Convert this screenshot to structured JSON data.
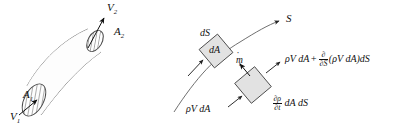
{
  "figure": {
    "background_color": "#ffffff",
    "line_color": "#555555",
    "label_color": "#111111",
    "element_fill": "#e2e2e2",
    "hatch_color": "#444444"
  },
  "left_diagram": {
    "name": "streamtube",
    "description": "Curved streamtube with hatched elliptical end cross-sections",
    "labels": {
      "inlet_area": "A",
      "inlet_area_sub": "1",
      "inlet_velocity": "V",
      "inlet_velocity_sub": "1",
      "outlet_area": "A",
      "outlet_area_sub": "2",
      "outlet_velocity": "V",
      "outlet_velocity_sub": "2"
    }
  },
  "right_diagram": {
    "name": "differential-element",
    "labels": {
      "streamline_axis": "S",
      "ds_label": "dS",
      "da_label": "dA",
      "mdot_label": "m",
      "mdot_accent": "̇",
      "mdot_sub": "t",
      "inflow_flux": "ρV dA"
    },
    "outflow_flux": {
      "lead": "ρV dA",
      "plus": "+",
      "frac_num": "∂",
      "frac_den": "∂S",
      "tail": "(ρV dA)dS"
    },
    "storage_term": {
      "frac_num": "∂ρ",
      "frac_den": "∂t",
      "tail": "dA dS"
    }
  }
}
